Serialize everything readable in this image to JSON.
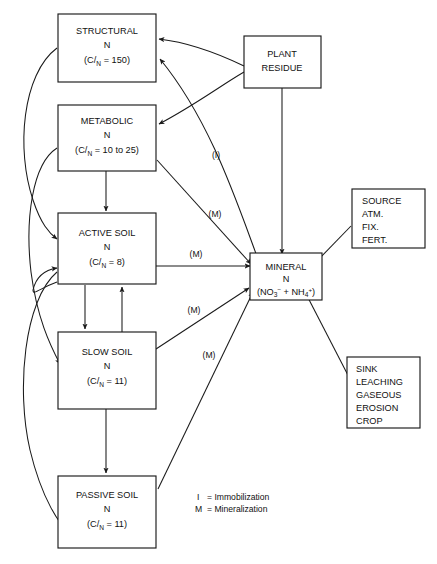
{
  "diagram": {
    "stroke_color": "#1a1a1a",
    "background_color": "#ffffff"
  },
  "nodes": {
    "structural": {
      "name": "STRUCTURAL",
      "n_label": "N",
      "ratio_prefix": "(C",
      "ratio_slash": "/",
      "ratio_sub": "N",
      "ratio_value": " = 150)"
    },
    "metabolic": {
      "name": "METABOLIC",
      "n_label": "N",
      "ratio_prefix": "(C",
      "ratio_slash": "/",
      "ratio_sub": "N",
      "ratio_value": " = 10 to 25)"
    },
    "active_soil": {
      "name": "ACTIVE SOIL",
      "n_label": "N",
      "ratio_prefix": "(C",
      "ratio_slash": "/",
      "ratio_sub": "N",
      "ratio_value": " = 8)"
    },
    "slow_soil": {
      "name": "SLOW SOIL",
      "n_label": "N",
      "ratio_prefix": "(C",
      "ratio_slash": "/",
      "ratio_sub": "N",
      "ratio_value": " = 11)"
    },
    "passive_soil": {
      "name": "PASSIVE SOIL",
      "n_label": "N",
      "ratio_prefix": "(C",
      "ratio_slash": "/",
      "ratio_sub": "N",
      "ratio_value": " = 11)"
    },
    "plant_residue": {
      "line1": "PLANT",
      "line2": "RESIDUE"
    },
    "mineral": {
      "name": "MINERAL",
      "n_label": "N",
      "formula_open": "(NO",
      "formula_sub1": "3",
      "formula_sup1": "−",
      "formula_plus": " + NH",
      "formula_sub2": "4",
      "formula_sup2": "+",
      "formula_close": ")"
    },
    "source": {
      "line1": "SOURCE",
      "line2": "ATM.",
      "line3": "FIX.",
      "line4": "FERT."
    },
    "sink": {
      "line1": "SINK",
      "line2": "LEACHING",
      "line3": "GASEOUS",
      "line4": "EROSION",
      "line5": "CROP"
    }
  },
  "edge_labels": {
    "immobilization_structural": "(I)",
    "mineralization_metabolic": "(M)",
    "mineralization_active": "(M)",
    "mineralization_slow": "(M)",
    "mineralization_passive": "(M)"
  },
  "legend": {
    "immobilization_key": "I",
    "immobilization_eq": "= Immobilization",
    "mineralization_key": "M",
    "mineralization_eq": "= Mineralization"
  }
}
